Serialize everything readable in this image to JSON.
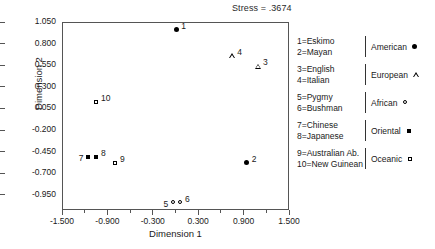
{
  "annotation": {
    "stress": "Stress = .3674"
  },
  "axes": {
    "xlabel": "Dimension 1",
    "ylabel": "Dimension 2",
    "xticks": [
      "-1.500",
      "-0.900",
      "-0.300",
      "0.300",
      "0.900",
      "1.500"
    ],
    "xtick_values": [
      -1.5,
      -0.9,
      -0.3,
      0.3,
      0.9,
      1.5
    ],
    "xminor_values": [
      -1.2,
      -0.6,
      0.0,
      0.6,
      1.2
    ],
    "yticks": [
      "1.050",
      "0.800",
      "0.550",
      "0.300",
      "0.050",
      "-0.200",
      "-0.450",
      "-0.700",
      "-0.950"
    ],
    "ytick_values": [
      1.05,
      0.8,
      0.55,
      0.3,
      0.05,
      -0.2,
      -0.45,
      -0.7,
      -0.95
    ],
    "xlim": [
      -1.5,
      1.5
    ],
    "ylim": [
      -1.125,
      1.05
    ]
  },
  "chart_data": {
    "type": "scatter",
    "title": "",
    "subtitle": "",
    "xlabel": "Dimension 1",
    "ylabel": "Dimension 2",
    "xlim": [
      -1.5,
      1.5
    ],
    "ylim": [
      -1.125,
      1.05
    ],
    "grid": false,
    "legend_position": "right",
    "annotations": [
      "Stress = .3674"
    ],
    "series": [
      {
        "name": "American",
        "marker": "filled-circle",
        "points": [
          {
            "id": "1",
            "label": "Eskimo",
            "x": 0.01,
            "y": 0.96,
            "label_side": "right"
          },
          {
            "id": "2",
            "label": "Mayan",
            "x": 0.94,
            "y": -0.58,
            "label_side": "right"
          }
        ]
      },
      {
        "name": "European",
        "marker": "open-triangle",
        "points": [
          {
            "id": "3",
            "label": "English",
            "x": 1.09,
            "y": 0.54,
            "label_side": "right"
          },
          {
            "id": "4",
            "label": "Italian",
            "x": 0.75,
            "y": 0.66,
            "label_side": "right"
          }
        ]
      },
      {
        "name": "African",
        "marker": "open-circle",
        "points": [
          {
            "id": "5",
            "label": "Pygmy",
            "x": -0.03,
            "y": -1.04,
            "label_side": "left"
          },
          {
            "id": "6",
            "label": "Bushman",
            "x": 0.06,
            "y": -1.04,
            "label_side": "right"
          }
        ]
      },
      {
        "name": "Oriental",
        "marker": "filled-square",
        "points": [
          {
            "id": "7",
            "label": "Chinese",
            "x": -1.15,
            "y": -0.51,
            "label_side": "left"
          },
          {
            "id": "8",
            "label": "Japanese",
            "x": -1.05,
            "y": -0.51,
            "label_side": "right"
          }
        ]
      },
      {
        "name": "Oceanic",
        "marker": "open-square",
        "points": [
          {
            "id": "9",
            "label": "Australian Ab.",
            "x": -0.8,
            "y": -0.58,
            "label_side": "right"
          },
          {
            "id": "10",
            "label": "New Guinean",
            "x": -1.05,
            "y": 0.13,
            "label_side": "right"
          }
        ]
      }
    ]
  },
  "legend": {
    "rows": [
      {
        "codes": [
          "1=Eskimo",
          "2=Mayan"
        ],
        "group": "American",
        "marker": "filled-circle"
      },
      {
        "codes": [
          "3=English",
          "4=Italian"
        ],
        "group": "European",
        "marker": "open-triangle"
      },
      {
        "codes": [
          "5=Pygmy",
          "6=Bushman"
        ],
        "group": "African",
        "marker": "open-circle"
      },
      {
        "codes": [
          "7=Chinese",
          "8=Japanese"
        ],
        "group": "Oriental",
        "marker": "filled-square"
      },
      {
        "codes": [
          "9=Australian Ab.",
          "10=New Guinean"
        ],
        "group": "Oceanic",
        "marker": "open-square"
      }
    ]
  }
}
